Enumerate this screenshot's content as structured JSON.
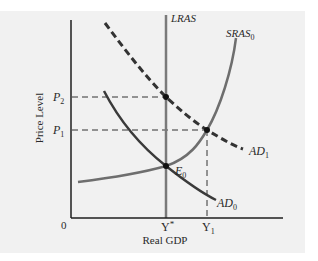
{
  "diagram": {
    "type": "AS-AD model",
    "axes": {
      "y_label": "Price Level",
      "x_label": "Real GDP",
      "origin_label": "0"
    },
    "y_ticks": [
      {
        "base": "P",
        "sub": "2"
      },
      {
        "base": "P",
        "sub": "1"
      }
    ],
    "x_ticks": [
      {
        "base": "Y",
        "sup": "*"
      },
      {
        "base": "Y",
        "sub": "1"
      }
    ],
    "curves": {
      "lras": {
        "label": "LRAS",
        "style": "solid",
        "color": "#7a7a7a"
      },
      "sras0": {
        "base": "SRAS",
        "sub": "0",
        "style": "solid",
        "color": "#6e6e6e"
      },
      "ad0": {
        "base": "AD",
        "sub": "0",
        "style": "solid",
        "color": "#3a3a3a"
      },
      "ad1": {
        "base": "AD",
        "sub": "1",
        "style": "dashed",
        "color": "#333333"
      }
    },
    "points": {
      "e0": {
        "base": "E",
        "sub": "0"
      }
    },
    "colors": {
      "panel_bg": "#f1f1f1",
      "axis": "#1e1e1e",
      "guide": "#333333",
      "dot": "#111111"
    }
  }
}
